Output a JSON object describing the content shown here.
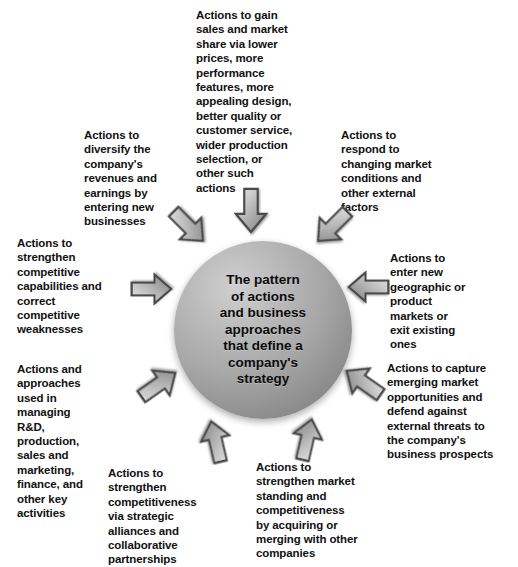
{
  "diagram": {
    "title": "The pattern of actions and business approaches that define a company's strategy",
    "core": {
      "text": "The pattern\nof actions\nand business\napproaches\nthat define a\ncompany's\nstrategy",
      "fill_color": "#a9a9a9",
      "shape": "circle"
    },
    "arrow_color": "#b3b3b3",
    "arrow_outline_color": "#3a3a3a",
    "arrow_count": 10,
    "labels": [
      {
        "id": "top",
        "position": "top",
        "text": "Actions to gain\nsales and market\nshare via lower\nprices, more\nperformance\nfeatures, more\nappealing design,\nbetter quality or\ncustomer service,\nwider production\nselection, or\nother such\nactions"
      },
      {
        "id": "top-left",
        "position": "top-left",
        "text": "Actions to\ndiversify the\ncompany's\nrevenues and\nearnings by\nentering new\nbusinesses"
      },
      {
        "id": "top-right",
        "position": "top-right",
        "text": "Actions to\nrespond to\nchanging market\nconditions and\nother external\nfactors"
      },
      {
        "id": "left",
        "position": "left",
        "text": "Actions to\nstrengthen\ncompetitive\ncapabilities and\ncorrect\ncompetitive\nweaknesses"
      },
      {
        "id": "right",
        "position": "right",
        "text": "Actions to\nenter new\ngeographic or\nproduct\nmarkets or\nexit existing\nones"
      },
      {
        "id": "lower-left",
        "position": "lower-left",
        "text": "Actions and\napproaches\nused in\nmanaging\nR&D,\nproduction,\nsales and\nmarketing,\nfinance, and\nother key\nactivities"
      },
      {
        "id": "lower-right",
        "position": "lower-right",
        "text": "Actions to capture\nemerging market\nopportunities and\ndefend against\nexternal threats to\nthe company's\nbusiness prospects"
      },
      {
        "id": "bottom-left",
        "position": "bottom-left",
        "text": "Actions to\nstrengthen\ncompetitiveness\nvia strategic\nalliances and\ncollaborative\npartnerships"
      },
      {
        "id": "bottom-right",
        "position": "bottom-right",
        "text": "Actions to\nstrengthen market\nstanding and\ncompetitiveness\nby acquiring or\nmerging with other\ncompanies"
      }
    ]
  }
}
